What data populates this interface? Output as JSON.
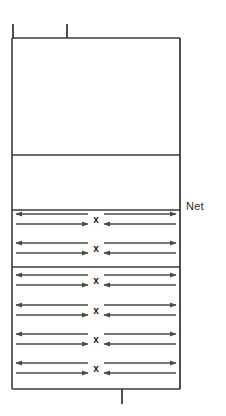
{
  "diagram": {
    "net_label": "Net",
    "center_marker": "x",
    "line_color": "#3a3a3a",
    "arrow_color": "#4a4a4a",
    "text_color": "#2b2b2b",
    "background_color": "#ffffff",
    "court": {
      "left": 12,
      "right": 180,
      "top": 38,
      "bottom": 389,
      "horizontal_lines": [
        155,
        210,
        267
      ],
      "top_ticks": [
        {
          "x": 13,
          "y_from": 24,
          "y_to": 38
        },
        {
          "x": 67,
          "y_from": 24,
          "y_to": 38
        }
      ],
      "bottom_ticks": [
        {
          "x": 122,
          "y_from": 389,
          "y_to": 404
        }
      ]
    },
    "rows": [
      {
        "y": 219,
        "section": "upper"
      },
      {
        "y": 248,
        "section": "upper"
      },
      {
        "y": 280,
        "section": "lower"
      },
      {
        "y": 310,
        "section": "lower"
      },
      {
        "y": 339,
        "section": "lower"
      },
      {
        "y": 368,
        "section": "lower"
      }
    ],
    "arrow_geometry": {
      "left_group_start": 16,
      "left_group_end": 88,
      "right_group_start": 104,
      "right_group_end": 176,
      "marker_x": 96,
      "pair_offset": 5,
      "left_top_direction": "left",
      "left_bottom_direction": "right",
      "right_top_direction": "right",
      "right_bottom_direction": "left"
    }
  }
}
